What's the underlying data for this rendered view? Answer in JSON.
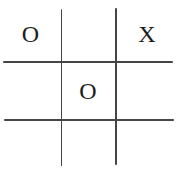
{
  "board": {
    "game": "tic-tac-toe",
    "rows": 3,
    "cols": 3,
    "cells": [
      {
        "pos": "top-left",
        "mark": "O"
      },
      {
        "pos": "top-center",
        "mark": ""
      },
      {
        "pos": "top-right",
        "mark": "X"
      },
      {
        "pos": "middle-left",
        "mark": ""
      },
      {
        "pos": "middle-center",
        "mark": "O"
      },
      {
        "pos": "middle-right",
        "mark": ""
      },
      {
        "pos": "bottom-left",
        "mark": ""
      },
      {
        "pos": "bottom-center",
        "mark": ""
      },
      {
        "pos": "bottom-right",
        "mark": ""
      }
    ]
  },
  "theme": {
    "background": "#ffffff",
    "grid_line_color": "#454545",
    "mark_color": "#1c1c1c"
  }
}
